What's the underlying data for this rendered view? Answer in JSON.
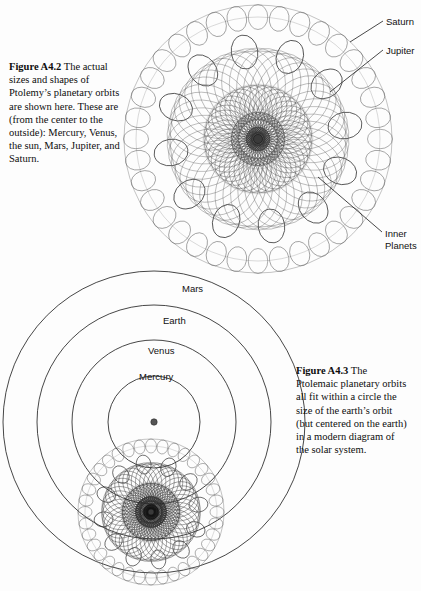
{
  "page": {
    "width": 421,
    "height": 591,
    "background": "#fdfdfd",
    "ink": "#1a1a1a"
  },
  "figure_a42": {
    "caption_label": "Figure A4.2",
    "caption_text": " The actual sizes and shapes of Ptolemy’s planetary orbits are shown here. These are (from the center to the outside): Mercury, Venus, the sun, Mars, Jupiter, and Saturn.",
    "pointer_labels": [
      {
        "name": "saturn",
        "text": "Saturn"
      },
      {
        "name": "jupiter",
        "text": "Jupiter"
      },
      {
        "name": "inner-planets",
        "text": "Inner\nPlanets"
      }
    ],
    "inner_planets_line1": "Inner",
    "inner_planets_line2": "Planets",
    "diagram": {
      "type": "ptolemaic-epicycles",
      "center": [
        258,
        139
      ],
      "outer_radius": 134,
      "bands": [
        {
          "planet": "Saturn",
          "deferent_r": 122,
          "epicycle_r": 12.5,
          "count": 36,
          "stroke": "#5a5a5a",
          "width": 0.55
        },
        {
          "planet": "Jupiter",
          "deferent_r": 88,
          "epicycle_r": 17.0,
          "count": 12,
          "stroke": "#2b2b2b",
          "width": 0.8
        },
        {
          "planet": "Mars",
          "deferent_r": 55,
          "epicycle_r": 36.0,
          "count": 46,
          "stroke": "#6a6a6a",
          "width": 0.45
        },
        {
          "planet": "Sun",
          "deferent_r": 30,
          "epicycle_r": 24.0,
          "count": 40,
          "stroke": "#4f4f4f",
          "width": 0.45
        },
        {
          "planet": "Venus",
          "deferent_r": 14,
          "epicycle_r": 13.0,
          "count": 34,
          "stroke": "#3d3d3d",
          "width": 0.45
        },
        {
          "planet": "Mercury",
          "deferent_r": 6,
          "epicycle_r": 6.0,
          "count": 28,
          "stroke": "#2a2a2a",
          "width": 0.5
        }
      ]
    }
  },
  "figure_a43": {
    "caption_label": "Figure A4.3",
    "caption_text": " The Ptolemaic planetary orbits all fit within a circle the size of the earth’s orbit (but centered on the earth) in a modern diagram of the solar system.",
    "orbit_labels": [
      {
        "name": "mars",
        "text": "Mars"
      },
      {
        "name": "earth",
        "text": "Earth"
      },
      {
        "name": "venus",
        "text": "Venus"
      },
      {
        "name": "mercury",
        "text": "Mercury"
      }
    ],
    "diagram": {
      "type": "heliocentric-orbits",
      "sun_center": [
        154,
        422
      ],
      "sun_dot_radius": 3.2,
      "orbits": [
        {
          "planet": "Mercury",
          "r": 46
        },
        {
          "planet": "Venus",
          "r": 82
        },
        {
          "planet": "Earth",
          "r": 117
        },
        {
          "planet": "Mars",
          "r": 151
        }
      ],
      "ptolemaic_inset": {
        "center": [
          151,
          512
        ],
        "outer_radius": 73,
        "bands": [
          {
            "planet": "Saturn",
            "deferent_r": 66,
            "epicycle_r": 7.0,
            "count": 36,
            "stroke": "#5a5a5a",
            "width": 0.5
          },
          {
            "planet": "Jupiter",
            "deferent_r": 48,
            "epicycle_r": 9.5,
            "count": 12,
            "stroke": "#2b2b2b",
            "width": 0.7
          },
          {
            "planet": "Mars",
            "deferent_r": 30,
            "epicycle_r": 19.5,
            "count": 46,
            "stroke": "#444444",
            "width": 0.5
          },
          {
            "planet": "Sun",
            "deferent_r": 16,
            "epicycle_r": 13.0,
            "count": 44,
            "stroke": "#333333",
            "width": 0.5
          },
          {
            "planet": "Venus",
            "deferent_r": 8,
            "epicycle_r": 7.5,
            "count": 36,
            "stroke": "#222222",
            "width": 0.5
          },
          {
            "planet": "Mercury",
            "deferent_r": 4,
            "epicycle_r": 3.5,
            "count": 28,
            "stroke": "#111111",
            "width": 0.5
          }
        ],
        "earth_dot_radius": 3.0
      }
    }
  },
  "leaders": [
    {
      "name": "leader-saturn",
      "x1": 383,
      "y1": 21,
      "x2": 350,
      "y2": 42
    },
    {
      "name": "leader-jupiter",
      "x1": 383,
      "y1": 50,
      "x2": 330,
      "y2": 92
    },
    {
      "name": "leader-inner",
      "x1": 382,
      "y1": 232,
      "x2": 318,
      "y2": 177
    }
  ]
}
